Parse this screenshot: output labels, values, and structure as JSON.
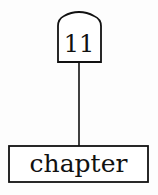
{
  "diagram": {
    "top_node": {
      "label": "11",
      "shape": "arched-top-box"
    },
    "bottom_node": {
      "label": "chapter",
      "shape": "rectangle"
    },
    "edge": {
      "from": "top_node",
      "to": "bottom_node",
      "style": "solid-line"
    },
    "colors": {
      "stroke": "#111111",
      "background": "#fdfdfd"
    }
  }
}
